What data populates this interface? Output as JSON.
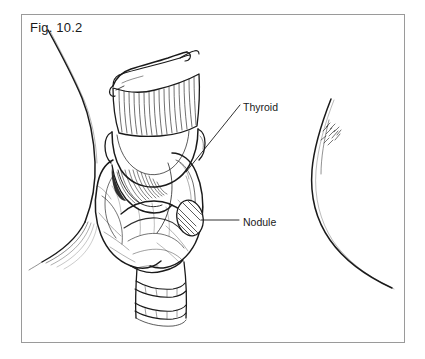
{
  "figure": {
    "label": "Fig. 10.2",
    "background_color": "#ffffff",
    "frame_color": "#9a9a9a",
    "ink_color": "#1a1a1a"
  },
  "callouts": [
    {
      "name": "thyroid",
      "label": "Thyroid",
      "leader": "diagonal",
      "leader_from": [
        240,
        105
      ],
      "leader_to": [
        186,
        172
      ]
    },
    {
      "name": "nodule",
      "label": "Nodule",
      "leader": "horizontal",
      "leader_from": [
        239,
        220
      ],
      "leader_to": [
        200,
        220
      ]
    }
  ],
  "anatomy": [
    {
      "name": "hyoid-bone",
      "label": "Hyoid bone"
    },
    {
      "name": "thyrohyoid-membrane",
      "label": "Thyrohyoid membrane"
    },
    {
      "name": "thyroid-cartilage",
      "label": "Thyroid cartilage"
    },
    {
      "name": "cricothyroid-membrane",
      "label": "Cricothyroid membrane"
    },
    {
      "name": "thyroid-gland-right-lobe",
      "label": "Right lobe of thyroid gland"
    },
    {
      "name": "thyroid-gland-left-lobe",
      "label": "Left lobe of thyroid gland"
    },
    {
      "name": "thyroid-isthmus",
      "label": "Isthmus"
    },
    {
      "name": "thyroid-nodule",
      "label": "Nodule"
    },
    {
      "name": "trachea",
      "label": "Trachea"
    },
    {
      "name": "neck-contour-left",
      "label": "Left neck contour"
    },
    {
      "name": "neck-contour-right",
      "label": "Right neck contour"
    },
    {
      "name": "clavicular-shading-left",
      "label": "Left clavicular shading"
    },
    {
      "name": "shading-marks-right",
      "label": "Right neck shading marks"
    }
  ]
}
